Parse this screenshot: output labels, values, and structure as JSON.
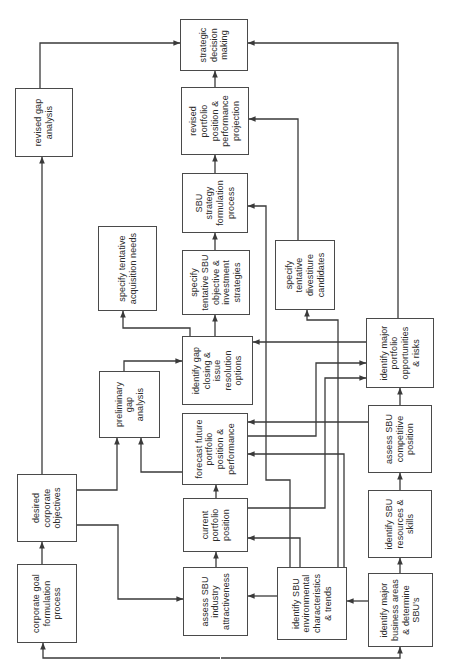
{
  "diagram": {
    "background_color": "#ffffff",
    "line_color": "#3a3a3a",
    "box_border_color": "#4a4a4a",
    "text_color": "#2b2b2b",
    "boxes": [
      {
        "id": "cgf",
        "lines": [
          "corporate goal",
          "formulation",
          "process"
        ],
        "x": 24,
        "y": 17,
        "w": 79,
        "h": 60
      },
      {
        "id": "dco",
        "lines": [
          "desired",
          "corporate",
          "objectives"
        ],
        "x": 125,
        "y": 17,
        "w": 68,
        "h": 60
      },
      {
        "id": "rga",
        "lines": [
          "revised gap",
          "analysis"
        ],
        "x": 510,
        "y": 15,
        "w": 69,
        "h": 58
      },
      {
        "id": "stan",
        "lines": [
          "specify tentative",
          "acquisition needs"
        ],
        "x": 356,
        "y": 98,
        "w": 85,
        "h": 59
      },
      {
        "id": "pga",
        "lines": [
          "preliminary",
          "gap",
          "analysis"
        ],
        "x": 229,
        "y": 99,
        "w": 67,
        "h": 61
      },
      {
        "id": "asia",
        "lines": [
          "assess SBU",
          "industry",
          "attractiveness"
        ],
        "x": 31,
        "y": 183,
        "w": 69,
        "h": 65
      },
      {
        "id": "cpp",
        "lines": [
          "current",
          "portfolio",
          "position"
        ],
        "x": 115,
        "y": 183,
        "w": 54,
        "h": 65
      },
      {
        "id": "ffp",
        "lines": [
          "forecast future",
          "portfolio",
          "position &",
          "performance"
        ],
        "x": 182,
        "y": 182,
        "w": 72,
        "h": 66
      },
      {
        "id": "igc",
        "lines": [
          "identify gap",
          "closing &",
          "issue",
          "resolution",
          "options"
        ],
        "x": 262,
        "y": 182,
        "w": 69,
        "h": 71
      },
      {
        "id": "stso",
        "lines": [
          "specify",
          "tentative SBU",
          "objective &",
          "investment",
          "strategies"
        ],
        "x": 352,
        "y": 182,
        "w": 65,
        "h": 68
      },
      {
        "id": "ssf",
        "lines": [
          "SBU",
          "strategy",
          "formulation",
          "process"
        ],
        "x": 434,
        "y": 182,
        "w": 60,
        "h": 66
      },
      {
        "id": "rpp",
        "lines": [
          "revised",
          "portfolio",
          "position &",
          "performance",
          "projection"
        ],
        "x": 512,
        "y": 181,
        "w": 68,
        "h": 68
      },
      {
        "id": "sdm",
        "lines": [
          "strategic",
          "decision",
          "making"
        ],
        "x": 596,
        "y": 180,
        "w": 52,
        "h": 68
      },
      {
        "id": "isec",
        "lines": [
          "identify SBU",
          "environmental",
          "characteristics",
          "& trends"
        ],
        "x": 27,
        "y": 277,
        "w": 73,
        "h": 70
      },
      {
        "id": "stdc",
        "lines": [
          "specify",
          "tentative",
          "divestiture",
          "candidates"
        ],
        "x": 357,
        "y": 275,
        "w": 70,
        "h": 60
      },
      {
        "id": "imba",
        "lines": [
          "identify major",
          "business areas",
          "& determine",
          "SBU's"
        ],
        "x": 20,
        "y": 368,
        "w": 74,
        "h": 65
      },
      {
        "id": "isrs",
        "lines": [
          "identify SBU",
          "resources &",
          "skills"
        ],
        "x": 109,
        "y": 368,
        "w": 68,
        "h": 64
      },
      {
        "id": "ascp",
        "lines": [
          "assess SBU",
          "competitive",
          "position"
        ],
        "x": 194,
        "y": 368,
        "w": 68,
        "h": 64
      },
      {
        "id": "impo",
        "lines": [
          "identify major",
          "portfolio",
          "opportunities",
          "& risks"
        ],
        "x": 279,
        "y": 366,
        "w": 70,
        "h": 68
      }
    ],
    "arrows": [
      {
        "name": "cgf-to-dco",
        "points": [
          [
            103,
            42
          ],
          [
            125,
            42
          ]
        ]
      },
      {
        "name": "dco-to-rga",
        "points": [
          [
            193,
            42
          ],
          [
            510,
            42
          ]
        ]
      },
      {
        "name": "rga-to-sdm",
        "points": [
          [
            579,
            40
          ],
          [
            624,
            40
          ],
          [
            624,
            180
          ]
        ]
      },
      {
        "name": "dco-to-pga",
        "points": [
          [
            177,
            77
          ],
          [
            177,
            117
          ],
          [
            229,
            117
          ]
        ]
      },
      {
        "name": "ffp-to-pga",
        "points": [
          [
            195,
            182
          ],
          [
            195,
            141
          ],
          [
            229,
            141
          ]
        ]
      },
      {
        "name": "pga-to-igc",
        "points": [
          [
            296,
            124
          ],
          [
            306,
            124
          ],
          [
            306,
            182
          ]
        ]
      },
      {
        "name": "dco-to-asia",
        "points": [
          [
            142,
            77
          ],
          [
            142,
            118
          ],
          [
            68,
            118
          ],
          [
            68,
            183
          ]
        ]
      },
      {
        "name": "asia-to-cpp",
        "points": [
          [
            100,
            216
          ],
          [
            115,
            216
          ]
        ]
      },
      {
        "name": "cpp-to-ffp",
        "points": [
          [
            169,
            216
          ],
          [
            182,
            216
          ]
        ]
      },
      {
        "name": "ascp-to-ffp",
        "points": [
          [
            245,
            368
          ],
          [
            245,
            248
          ]
        ]
      },
      {
        "name": "igc-to-stso",
        "points": [
          [
            331,
            215
          ],
          [
            352,
            215
          ]
        ]
      },
      {
        "name": "igc-to-stan",
        "points": [
          [
            331,
            190
          ],
          [
            339,
            190
          ],
          [
            339,
            123
          ],
          [
            356,
            123
          ]
        ]
      },
      {
        "name": "stso-to-ssf",
        "points": [
          [
            417,
            215
          ],
          [
            434,
            215
          ]
        ]
      },
      {
        "name": "ssf-to-rpp",
        "points": [
          [
            494,
            215
          ],
          [
            512,
            215
          ]
        ]
      },
      {
        "name": "rpp-to-sdm",
        "points": [
          [
            580,
            215
          ],
          [
            596,
            215
          ]
        ]
      },
      {
        "name": "stdc-to-rpp",
        "points": [
          [
            427,
            298
          ],
          [
            548,
            298
          ],
          [
            548,
            249
          ]
        ]
      },
      {
        "name": "impo-to-sdm",
        "points": [
          [
            349,
            398
          ],
          [
            624,
            398
          ],
          [
            624,
            248
          ]
        ]
      },
      {
        "name": "impo-to-igc",
        "points": [
          [
            325,
            366
          ],
          [
            325,
            253
          ]
        ]
      },
      {
        "name": "ascp-to-impo",
        "points": [
          [
            262,
            400
          ],
          [
            279,
            400
          ]
        ]
      },
      {
        "name": "isrs-to-ascp",
        "points": [
          [
            177,
            400
          ],
          [
            194,
            400
          ]
        ]
      },
      {
        "name": "imba-to-isrs",
        "points": [
          [
            94,
            400
          ],
          [
            109,
            400
          ]
        ]
      },
      {
        "name": "imba-to-isec",
        "points": [
          [
            66,
            368
          ],
          [
            66,
            347
          ]
        ]
      },
      {
        "name": "feedback-to-cgf",
        "points": [
          [
            9,
            220
          ],
          [
            9,
            43
          ],
          [
            24,
            43
          ]
        ]
      },
      {
        "name": "feedback-to-imba",
        "points": [
          [
            9,
            221
          ],
          [
            9,
            400
          ],
          [
            20,
            400
          ]
        ]
      },
      {
        "name": "isec-to-asia",
        "points": [
          [
            71,
            277
          ],
          [
            71,
            248
          ]
        ]
      },
      {
        "name": "isec-to-ssf",
        "points": [
          [
            100,
            290
          ],
          [
            187,
            290
          ],
          [
            187,
            266
          ],
          [
            461,
            266
          ],
          [
            461,
            248
          ]
        ]
      },
      {
        "name": "isec-to-cpp",
        "points": [
          [
            100,
            300
          ],
          [
            129,
            300
          ],
          [
            129,
            248
          ]
        ]
      },
      {
        "name": "isec-to-ffp",
        "points": [
          [
            100,
            344
          ],
          [
            213,
            344
          ],
          [
            213,
            248
          ]
        ]
      },
      {
        "name": "isec-to-stdc",
        "points": [
          [
            100,
            338
          ],
          [
            347,
            338
          ],
          [
            347,
            307
          ],
          [
            357,
            307
          ]
        ]
      },
      {
        "name": "ffp-to-impo",
        "points": [
          [
            231,
            248
          ],
          [
            231,
            316
          ],
          [
            304,
            316
          ],
          [
            304,
            366
          ]
        ]
      },
      {
        "name": "cpp-to-impo",
        "points": [
          [
            159,
            248
          ],
          [
            159,
            325
          ],
          [
            289,
            325
          ],
          [
            289,
            366
          ]
        ]
      }
    ]
  }
}
